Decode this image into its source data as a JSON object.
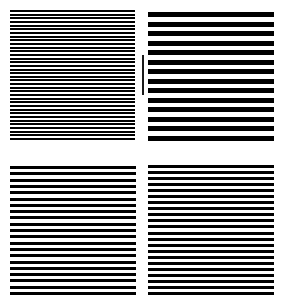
{
  "figure": {
    "line_color": "#000000",
    "background_color": "#ffffff",
    "panels": [
      {
        "id": "top-left",
        "x": 10,
        "y": 10,
        "width": 125,
        "height": 130,
        "line_count": 36,
        "line_thickness": 2
      },
      {
        "id": "top-right",
        "x": 148,
        "y": 12,
        "width": 126,
        "height": 129,
        "line_count": 14,
        "line_thickness": 5
      },
      {
        "id": "bottom-left",
        "x": 10,
        "y": 166,
        "width": 126,
        "height": 129,
        "line_count": 21,
        "line_thickness": 3
      },
      {
        "id": "bottom-right",
        "x": 148,
        "y": 165,
        "width": 126,
        "height": 130,
        "line_count": 22,
        "line_thickness": 3
      }
    ],
    "marker": {
      "x": 142,
      "y": 55,
      "width": 2,
      "height": 40,
      "color": "#1a1a1a"
    }
  }
}
